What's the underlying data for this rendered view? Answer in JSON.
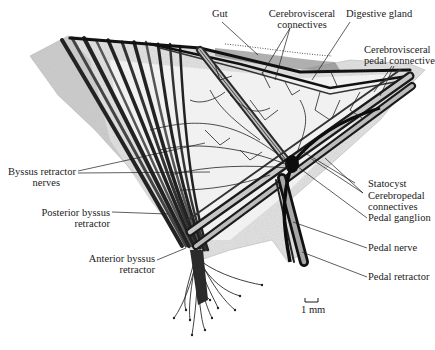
{
  "figure": {
    "scale_bar": {
      "label": "1 mm"
    }
  },
  "labels": {
    "gut": "Gut",
    "cerebrovisceral_connectives": [
      "Cerebrovisceral",
      "connectives"
    ],
    "digestive_gland": "Digestive gland",
    "cerebrovisceral_pedal_connective": [
      "Cerebrovisceral",
      "pedal connective"
    ],
    "byssus_retractor_nerves": [
      "Byssus retractor",
      "nerves"
    ],
    "posterior_byssus_retractor": [
      "Posterior byssus",
      "retractor"
    ],
    "anterior_byssus_retractor": [
      "Anterior byssus",
      "retractor"
    ],
    "statocyst": "Statocyst",
    "cerebropedal_connectives": [
      "Cerebropedal",
      "connectives"
    ],
    "pedal_ganglion": "Pedal ganglion",
    "pedal_nerve": "Pedal nerve",
    "pedal_retractor": "Pedal retractor"
  }
}
